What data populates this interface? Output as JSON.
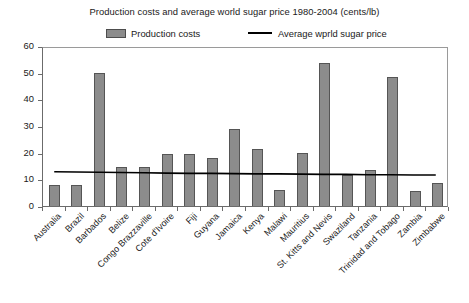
{
  "chart_data": {
    "type": "bar",
    "title": "Production costs and average world sugar price 1980-2004 (cents/lb)",
    "xlabel": "",
    "ylabel": "",
    "ylim": [
      0,
      60
    ],
    "yticks": [
      0,
      10,
      20,
      30,
      40,
      50,
      60
    ],
    "grid": false,
    "legend_position": "top-center",
    "categories": [
      "Australia",
      "Brazil",
      "Barbados",
      "Belize",
      "Congo Brazzaville",
      "Cote d'Ivoire",
      "Fiji",
      "Guyana",
      "Jamaica",
      "Kenya",
      "Malawi",
      "Mauritius",
      "St. Kitts and Nevis",
      "Swaziland",
      "Tanzania",
      "Trinidad and Tobago",
      "Zambia",
      "Zimbabwe"
    ],
    "series": [
      {
        "name": "Production costs",
        "type": "bar",
        "color": "#8c8c8c",
        "values": [
          8,
          8,
          50,
          14.5,
          14.5,
          19.5,
          19.5,
          18,
          29,
          21.5,
          6,
          20,
          53.5,
          11.5,
          13.5,
          48.5,
          5.5,
          8.5
        ]
      },
      {
        "name": "Average wprld sugar price",
        "type": "line",
        "color": "#000000",
        "values": [
          13,
          12.9,
          12.8,
          12.7,
          12.6,
          12.5,
          12.4,
          12.4,
          12.3,
          12.2,
          12.2,
          12.1,
          12.0,
          12.0,
          11.9,
          11.9,
          11.8,
          11.8
        ]
      }
    ]
  },
  "legend": {
    "bars_label": "Production costs",
    "line_label": "Average wprld sugar price"
  }
}
